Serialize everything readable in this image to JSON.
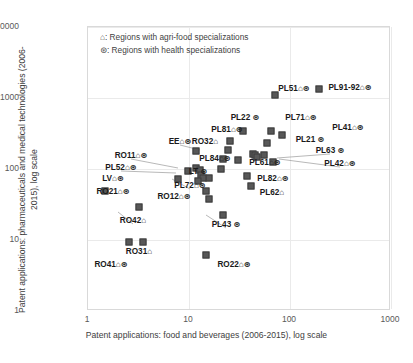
{
  "chart_data": {
    "type": "scatter",
    "title": "",
    "xlabel": "Patent applications: food and beverages (2006-2015), log scale",
    "ylabel": "Patent applications: pharmaceuticals and medical technologies (2006-2015), log scale",
    "xscale": "log",
    "yscale": "log",
    "xlim": [
      1,
      1000
    ],
    "ylim": [
      1,
      10000
    ],
    "xticks": [
      "1",
      "10",
      "100",
      "1000"
    ],
    "yticks": [
      "1",
      "10",
      "100",
      "1000",
      "10000"
    ],
    "grid": true,
    "legend": {
      "position": "top-left-inside",
      "entries": [
        "⌂: Regions with agri-food specializations",
        "⊛: Regions with health specializations"
      ]
    },
    "points": [
      {
        "label": "PL51⌂⊛",
        "x": 72,
        "y": 1070,
        "lx": 294,
        "ly": 88,
        "leader": false
      },
      {
        "label": "PL91-92⌂⊛",
        "x": 200,
        "y": 1280,
        "lx": 350,
        "ly": 87,
        "leader": false
      },
      {
        "label": "PL22 ⊛",
        "x": 35,
        "y": 330,
        "lx": 245,
        "ly": 117,
        "leader": false
      },
      {
        "label": "PL71⌂⊛",
        "x": 66,
        "y": 330,
        "lx": 301,
        "ly": 117,
        "leader": false
      },
      {
        "label": "PL41⌂⊛",
        "x": 85,
        "y": 290,
        "lx": 348,
        "ly": 127,
        "leader": false
      },
      {
        "label": "PL81⌂⊛",
        "x": 26,
        "y": 240,
        "lx": 227,
        "ly": 129,
        "leader": false
      },
      {
        "label": "PL21 ⊛",
        "x": 60,
        "y": 225,
        "lx": 310,
        "ly": 139,
        "leader": false
      },
      {
        "label": "RO32⌂",
        "x": 25,
        "y": 180,
        "lx": 205,
        "ly": 141,
        "leader": false
      },
      {
        "label": "EE⌂⊛",
        "x": 12,
        "y": 175,
        "lx": 180,
        "ly": 141,
        "leader": true,
        "tx": 200,
        "ty": 150
      },
      {
        "label": "PL63 ⊛",
        "x": 57,
        "y": 152,
        "lx": 330,
        "ly": 150,
        "leader": true,
        "tx": 277,
        "ty": 158
      },
      {
        "label": "PL84⌂⊛",
        "x": 22,
        "y": 132,
        "lx": 215,
        "ly": 158,
        "leader": false
      },
      {
        "label": "PL61⌂⊛",
        "x": 31,
        "y": 130,
        "lx": 265,
        "ly": 162,
        "leader": false
      },
      {
        "label": "PL42⌂⊛",
        "x": 70,
        "y": 122,
        "lx": 340,
        "ly": 163,
        "leader": true,
        "tx": 279,
        "ty": 159
      },
      {
        "label": "RO11⌂⊛",
        "x": 12,
        "y": 100,
        "lx": 131,
        "ly": 155,
        "leader": true,
        "tx": 178,
        "ty": 168
      },
      {
        "label": "PL52⌂⊛",
        "x": 10,
        "y": 90,
        "lx": 121,
        "ly": 167,
        "leader": true,
        "tx": 176,
        "ty": 173
      },
      {
        "label": "LT ⊛",
        "x": 21,
        "y": 98,
        "lx": 198,
        "ly": 171,
        "leader": false
      },
      {
        "label": "PL82⌂⊛",
        "x": 38,
        "y": 78,
        "lx": 273,
        "ly": 178,
        "leader": false
      },
      {
        "label": "LV⌂⊛",
        "x": 8,
        "y": 70,
        "lx": 113,
        "ly": 178,
        "leader": false
      },
      {
        "label": "PL72⌂⊛",
        "x": 16,
        "y": 72,
        "lx": 190,
        "ly": 185,
        "leader": true,
        "tx": 172,
        "ty": 179
      },
      {
        "label": "RO21⌂⊛",
        "x": 1.5,
        "y": 48,
        "lx": 113,
        "ly": 191,
        "leader": false
      },
      {
        "label": "PL62⌂",
        "x": 42,
        "y": 55,
        "lx": 272,
        "ly": 192,
        "leader": false
      },
      {
        "label": "RO12⌂⊛",
        "x": 15,
        "y": 48,
        "lx": 174,
        "ly": 196,
        "leader": false
      },
      {
        "label": "RO42⌂",
        "x": 3.3,
        "y": 28,
        "lx": 133,
        "ly": 220,
        "leader": true,
        "tx": 118,
        "ty": 212
      },
      {
        "label": "PL43 ⊛",
        "x": 22,
        "y": 22,
        "lx": 226,
        "ly": 224,
        "leader": true,
        "tx": 206,
        "ty": 215
      },
      {
        "label": "RO31⌂",
        "x": 3.6,
        "y": 9,
        "lx": 139,
        "ly": 251,
        "leader": false
      },
      {
        "label": "RO41⌂⊛",
        "x": 2.6,
        "y": 9,
        "lx": 111,
        "ly": 264,
        "leader": false
      },
      {
        "label": "RO22⌂⊛",
        "x": 15,
        "y": 6,
        "lx": 234,
        "ly": 264,
        "leader": false
      }
    ],
    "marker_points": [
      {
        "x": 72,
        "y": 1070
      },
      {
        "x": 200,
        "y": 1280
      },
      {
        "x": 35,
        "y": 330
      },
      {
        "x": 66,
        "y": 330
      },
      {
        "x": 85,
        "y": 290
      },
      {
        "x": 26,
        "y": 240
      },
      {
        "x": 60,
        "y": 225
      },
      {
        "x": 25,
        "y": 180
      },
      {
        "x": 12,
        "y": 175
      },
      {
        "x": 57,
        "y": 152
      },
      {
        "x": 22,
        "y": 132
      },
      {
        "x": 31,
        "y": 130
      },
      {
        "x": 70,
        "y": 122
      },
      {
        "x": 12,
        "y": 100
      },
      {
        "x": 10,
        "y": 90
      },
      {
        "x": 21,
        "y": 98
      },
      {
        "x": 38,
        "y": 78
      },
      {
        "x": 8,
        "y": 70
      },
      {
        "x": 16,
        "y": 72
      },
      {
        "x": 1.5,
        "y": 48
      },
      {
        "x": 42,
        "y": 55
      },
      {
        "x": 15,
        "y": 48
      },
      {
        "x": 3.3,
        "y": 28
      },
      {
        "x": 22,
        "y": 22
      },
      {
        "x": 3.6,
        "y": 9
      },
      {
        "x": 2.6,
        "y": 9
      },
      {
        "x": 15,
        "y": 6
      },
      {
        "x": 13,
        "y": 95
      },
      {
        "x": 13.5,
        "y": 80
      },
      {
        "x": 14,
        "y": 72
      },
      {
        "x": 12.5,
        "y": 66
      },
      {
        "x": 44,
        "y": 160
      },
      {
        "x": 46,
        "y": 150
      },
      {
        "x": 48,
        "y": 145
      },
      {
        "x": 16,
        "y": 37
      }
    ]
  },
  "axis": {
    "ylabel": "Patent applications: pharmaceuticals and medical technologies (2006-2015), log scale",
    "xlabel": "Patent applications: food and beverages (2006-2015), log scale"
  }
}
